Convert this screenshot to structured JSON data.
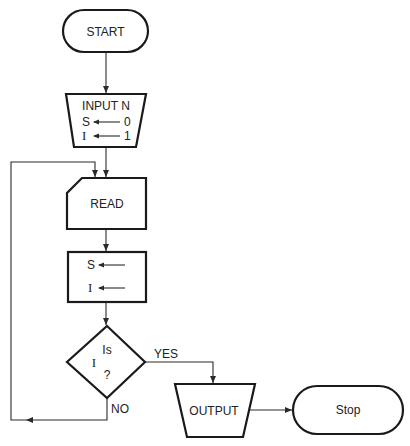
{
  "flowchart": {
    "start": {
      "label": "START"
    },
    "input": {
      "title": "INPUT N",
      "row1_var": "S",
      "row1_val": "0",
      "row2_var": "I",
      "row2_val": "1"
    },
    "read": {
      "label": "READ"
    },
    "assign": {
      "row1_var": "S",
      "row2_var": "I"
    },
    "decision": {
      "line1": "Is",
      "line2": "I",
      "line3": "?",
      "yes_label": "YES",
      "no_label": "NO"
    },
    "output": {
      "label": "OUTPUT"
    },
    "stop": {
      "label": "Stop"
    }
  }
}
